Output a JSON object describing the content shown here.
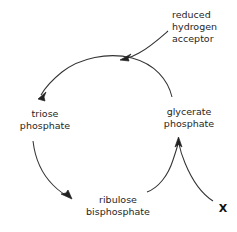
{
  "diagram": {
    "background_color": "#ffffff",
    "stroke_color": "#333333",
    "text_color": "#262626"
  },
  "nodes": {
    "triose_phosphate": {
      "line1": "triose",
      "line2": "phosphate",
      "x": 45,
      "y": 108
    },
    "glycerate_phosphate": {
      "line1": "glycerate",
      "line2": "phosphate",
      "x": 189,
      "y": 106
    },
    "ribulose_bisphosphate": {
      "line1": "ribulose",
      "line2": "bisphosphate",
      "x": 118,
      "y": 194
    },
    "reduced_hydrogen_acceptor": {
      "line1": "reduced",
      "line2": "hydrogen",
      "line3": "acceptor",
      "x": 172,
      "y": 9
    },
    "unknown_input": {
      "label": "X",
      "x": 223,
      "y": 203
    }
  },
  "arrows": [
    {
      "name": "glycerate-to-triose",
      "from": "glycerate phosphate",
      "to": "triose phosphate",
      "direction": "counter-clockwise-top"
    },
    {
      "name": "reduced-hydrogen-acceptor-into-cycle",
      "from": "reduced hydrogen acceptor",
      "to": "top arc junction",
      "direction": "down-left"
    },
    {
      "name": "triose-to-ribulose",
      "from": "triose phosphate",
      "to": "ribulose bisphosphate",
      "direction": "down-right"
    },
    {
      "name": "ribulose-to-glycerate",
      "from": "ribulose bisphosphate",
      "to": "glycerate phosphate",
      "direction": "up"
    },
    {
      "name": "x-to-glycerate",
      "from": "X",
      "to": "glycerate phosphate",
      "direction": "up-left"
    }
  ]
}
